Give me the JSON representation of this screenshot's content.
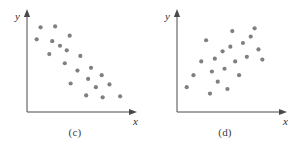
{
  "figure": {
    "background_color": "#ffffff",
    "panel_count": 2
  },
  "style": {
    "dot_color": "#808080",
    "dot_radius": 2.1,
    "axis_color": "#4a4a4a",
    "axis_width": 1,
    "caption_color": "#3b3b3b",
    "label_color": "#2f2f2f"
  },
  "panels": [
    {
      "id": "c",
      "caption": "(c)",
      "y_axis_label": "y",
      "x_axis_label": "x",
      "origin": {
        "x": 27,
        "y": 112
      },
      "x_axis_end": {
        "x": 132,
        "y": 112
      },
      "y_axis_top": {
        "x": 27,
        "y": 14
      }
    },
    {
      "id": "d",
      "caption": "(d)",
      "y_axis_label": "y",
      "x_axis_label": "x",
      "origin": {
        "x": 27,
        "y": 112
      },
      "x_axis_end": {
        "x": 132,
        "y": 112
      },
      "y_axis_top": {
        "x": 27,
        "y": 14
      }
    }
  ],
  "chart_data": [
    {
      "type": "scatter",
      "title": "(c)",
      "xlabel": "x",
      "ylabel": "y",
      "grid": false,
      "legend": false,
      "axis_style": "arrow-headed, no tick marks, no tick labels",
      "relationship": "negative linear correlation",
      "n_points": 20,
      "xlim": [
        0,
        100
      ],
      "ylim": [
        0,
        100
      ],
      "points": [
        {
          "x": 14,
          "y": 92
        },
        {
          "x": 29,
          "y": 93
        },
        {
          "x": 10,
          "y": 79
        },
        {
          "x": 26,
          "y": 77
        },
        {
          "x": 44,
          "y": 83
        },
        {
          "x": 34,
          "y": 72
        },
        {
          "x": 23,
          "y": 63
        },
        {
          "x": 41,
          "y": 67
        },
        {
          "x": 39,
          "y": 53
        },
        {
          "x": 55,
          "y": 61
        },
        {
          "x": 52,
          "y": 45
        },
        {
          "x": 66,
          "y": 48
        },
        {
          "x": 63,
          "y": 36
        },
        {
          "x": 77,
          "y": 40
        },
        {
          "x": 45,
          "y": 31
        },
        {
          "x": 71,
          "y": 27
        },
        {
          "x": 85,
          "y": 30
        },
        {
          "x": 61,
          "y": 18
        },
        {
          "x": 78,
          "y": 16
        },
        {
          "x": 96,
          "y": 17
        }
      ]
    },
    {
      "type": "scatter",
      "title": "(d)",
      "xlabel": "x",
      "ylabel": "y",
      "grid": false,
      "legend": false,
      "axis_style": "arrow-headed, no tick marks, no tick labels",
      "relationship": "positive linear correlation",
      "n_points": 21,
      "xlim": [
        0,
        100
      ],
      "ylim": [
        0,
        100
      ],
      "points": [
        {
          "x": 10,
          "y": 27
        },
        {
          "x": 17,
          "y": 40
        },
        {
          "x": 25,
          "y": 55
        },
        {
          "x": 30,
          "y": 78
        },
        {
          "x": 34,
          "y": 20
        },
        {
          "x": 36,
          "y": 44
        },
        {
          "x": 39,
          "y": 58
        },
        {
          "x": 42,
          "y": 33
        },
        {
          "x": 47,
          "y": 66
        },
        {
          "x": 49,
          "y": 47
        },
        {
          "x": 52,
          "y": 25
        },
        {
          "x": 55,
          "y": 71
        },
        {
          "x": 57,
          "y": 88
        },
        {
          "x": 60,
          "y": 55
        },
        {
          "x": 64,
          "y": 40
        },
        {
          "x": 68,
          "y": 75
        },
        {
          "x": 72,
          "y": 60
        },
        {
          "x": 76,
          "y": 82
        },
        {
          "x": 80,
          "y": 91
        },
        {
          "x": 84,
          "y": 68
        },
        {
          "x": 88,
          "y": 57
        }
      ]
    }
  ]
}
